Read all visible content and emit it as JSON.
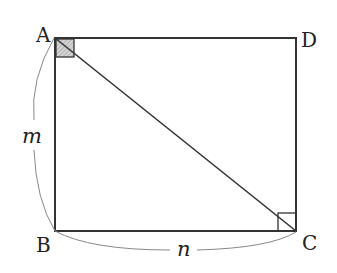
{
  "diagram": {
    "type": "geometry",
    "shape": "rectangle ABCD with diagonal AC",
    "vertices": {
      "A": {
        "label": "A",
        "x": 55,
        "y": 38
      },
      "B": {
        "label": "B",
        "x": 55,
        "y": 231
      },
      "C": {
        "label": "C",
        "x": 296,
        "y": 231
      },
      "D": {
        "label": "D",
        "x": 296,
        "y": 38
      }
    },
    "side_labels": {
      "AB": "m",
      "BC": "n"
    },
    "right_angle_marks": [
      {
        "at": "A",
        "shaded": true
      },
      {
        "at": "C",
        "shaded": false
      }
    ],
    "colors": {
      "stroke": "#333333",
      "shade": "#bbbbbb",
      "brace": "#888888"
    }
  }
}
